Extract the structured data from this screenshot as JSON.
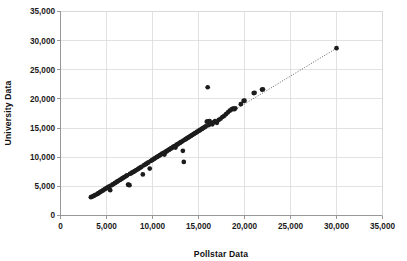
{
  "chart_data": {
    "type": "scatter",
    "title": "",
    "xlabel": "Pollstar Data",
    "ylabel": "University Data",
    "xlim": [
      0,
      35000
    ],
    "ylim": [
      0,
      35000
    ],
    "grid": true,
    "legend": null,
    "xticks": [
      0,
      5000,
      10000,
      15000,
      20000,
      25000,
      30000,
      35000
    ],
    "yticks": [
      0,
      5000,
      10000,
      15000,
      20000,
      25000,
      30000,
      35000
    ],
    "xticklabels": [
      "0",
      "5,000",
      "10,000",
      "15,000",
      "20,000",
      "25,000",
      "30,000",
      "35,000"
    ],
    "yticklabels": [
      "0",
      "5,000",
      "10,000",
      "15,000",
      "20,000",
      "25,000",
      "30,000",
      "35,000"
    ],
    "point_color": "#1c1c1c",
    "grid_color": "#d6d6d6",
    "axis_color": "#8d8d8d",
    "trendline": {
      "style": "dotted",
      "color": "#3a3a3a",
      "x": [
        3300,
        30000
      ],
      "y": [
        3150,
        28700
      ]
    },
    "series": [
      {
        "name": "Venues",
        "points": [
          [
            3300,
            3150
          ],
          [
            3450,
            3250
          ],
          [
            3600,
            3350
          ],
          [
            3750,
            3500
          ],
          [
            3900,
            3600
          ],
          [
            4050,
            3750
          ],
          [
            4150,
            3850
          ],
          [
            4300,
            4000
          ],
          [
            4400,
            4100
          ],
          [
            4550,
            4250
          ],
          [
            4650,
            4350
          ],
          [
            4800,
            4500
          ],
          [
            4900,
            4600
          ],
          [
            5050,
            4750
          ],
          [
            5150,
            4850
          ],
          [
            5300,
            5000
          ],
          [
            5400,
            4350
          ],
          [
            5500,
            5150
          ],
          [
            5650,
            5300
          ],
          [
            5750,
            5400
          ],
          [
            5900,
            5550
          ],
          [
            6000,
            5650
          ],
          [
            6150,
            5800
          ],
          [
            6250,
            5900
          ],
          [
            6400,
            6050
          ],
          [
            6500,
            6150
          ],
          [
            6650,
            6300
          ],
          [
            6750,
            6400
          ],
          [
            6900,
            6550
          ],
          [
            7000,
            6650
          ],
          [
            7150,
            6800
          ],
          [
            7250,
            6900
          ],
          [
            7350,
            5300
          ],
          [
            7400,
            5250
          ],
          [
            7500,
            5200
          ],
          [
            7550,
            7150
          ],
          [
            7700,
            7250
          ],
          [
            7800,
            7400
          ],
          [
            7950,
            7500
          ],
          [
            8050,
            7600
          ],
          [
            8200,
            7750
          ],
          [
            8300,
            7850
          ],
          [
            8450,
            8000
          ],
          [
            8550,
            8100
          ],
          [
            8700,
            8250
          ],
          [
            8800,
            8350
          ],
          [
            8950,
            7050
          ],
          [
            9050,
            8600
          ],
          [
            9200,
            8750
          ],
          [
            9300,
            8850
          ],
          [
            9450,
            9000
          ],
          [
            9550,
            9100
          ],
          [
            9700,
            8050
          ],
          [
            9800,
            9350
          ],
          [
            9950,
            9500
          ],
          [
            10050,
            9600
          ],
          [
            10200,
            9750
          ],
          [
            10300,
            9850
          ],
          [
            10450,
            10000
          ],
          [
            10550,
            10100
          ],
          [
            10700,
            10250
          ],
          [
            10800,
            10350
          ],
          [
            10950,
            10500
          ],
          [
            11050,
            10600
          ],
          [
            11200,
            10750
          ],
          [
            11300,
            10450
          ],
          [
            11400,
            10900
          ],
          [
            11500,
            11000
          ],
          [
            11600,
            11100
          ],
          [
            11700,
            11200
          ],
          [
            11800,
            11300
          ],
          [
            11900,
            11400
          ],
          [
            12000,
            11500
          ],
          [
            12100,
            11600
          ],
          [
            12200,
            11700
          ],
          [
            12300,
            11800
          ],
          [
            12400,
            11900
          ],
          [
            12500,
            11650
          ],
          [
            12600,
            12100
          ],
          [
            12700,
            12200
          ],
          [
            12800,
            12300
          ],
          [
            12900,
            12400
          ],
          [
            13000,
            12500
          ],
          [
            13100,
            12600
          ],
          [
            13200,
            12700
          ],
          [
            13300,
            11100
          ],
          [
            13350,
            12850
          ],
          [
            13400,
            9200
          ],
          [
            13500,
            13000
          ],
          [
            13600,
            13100
          ],
          [
            13700,
            13200
          ],
          [
            13800,
            13300
          ],
          [
            13900,
            13400
          ],
          [
            14000,
            13500
          ],
          [
            14100,
            13600
          ],
          [
            14200,
            13700
          ],
          [
            14300,
            13800
          ],
          [
            14400,
            13900
          ],
          [
            14500,
            14000
          ],
          [
            14600,
            14100
          ],
          [
            14700,
            14200
          ],
          [
            14800,
            14300
          ],
          [
            14900,
            14400
          ],
          [
            15000,
            14500
          ],
          [
            15100,
            14600
          ],
          [
            15200,
            14700
          ],
          [
            15300,
            14800
          ],
          [
            15400,
            14900
          ],
          [
            15500,
            15000
          ],
          [
            15600,
            15100
          ],
          [
            15700,
            15200
          ],
          [
            15800,
            15300
          ],
          [
            15900,
            16100
          ],
          [
            16000,
            22000
          ],
          [
            16050,
            16150
          ],
          [
            16100,
            15500
          ],
          [
            16200,
            16200
          ],
          [
            16300,
            15750
          ],
          [
            16400,
            15800
          ],
          [
            16500,
            15650
          ],
          [
            16600,
            16000
          ],
          [
            16800,
            16200
          ],
          [
            17000,
            15900
          ],
          [
            17200,
            16400
          ],
          [
            17400,
            16600
          ],
          [
            17600,
            16900
          ],
          [
            17800,
            17100
          ],
          [
            18000,
            17400
          ],
          [
            18200,
            17700
          ],
          [
            18400,
            18000
          ],
          [
            18600,
            18200
          ],
          [
            18700,
            18300
          ],
          [
            18800,
            18350
          ],
          [
            18900,
            18250
          ],
          [
            19000,
            18400
          ],
          [
            19600,
            19100
          ],
          [
            19900,
            19650
          ],
          [
            20000,
            19700
          ],
          [
            21000,
            21000
          ],
          [
            21100,
            21050
          ],
          [
            21900,
            21600
          ],
          [
            22000,
            21650
          ],
          [
            30000,
            28700
          ]
        ]
      }
    ]
  },
  "axes": {
    "x_title": "Pollstar Data",
    "y_title": "University Data"
  }
}
